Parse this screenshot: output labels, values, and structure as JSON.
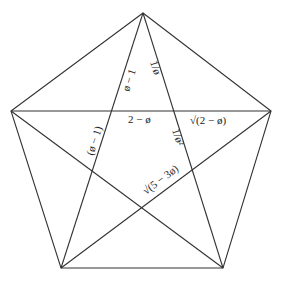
{
  "diagram": {
    "type": "pentagon-with-pentagram",
    "colors": {
      "line": "#333333",
      "text": "#222222",
      "background": "#ffffff"
    },
    "vertices": {
      "top": [
        143,
        13
      ],
      "right": [
        271,
        111
      ],
      "bottom_right": [
        223,
        268
      ],
      "bottom_left": [
        61,
        268
      ],
      "left": [
        11,
        111
      ]
    },
    "labels": {
      "phi_minus_1": "ø − 1",
      "one_over_phi": "1/ø",
      "two_minus_phi": "2 − ø",
      "sqrt_two_minus_phi": "√(2 − ø)",
      "one_over_phi_squared": "1/ø²",
      "paren_phi_minus_1": "(ø − 1)",
      "sqrt_five_minus_three_phi": "√(5 − 3ø)"
    }
  }
}
